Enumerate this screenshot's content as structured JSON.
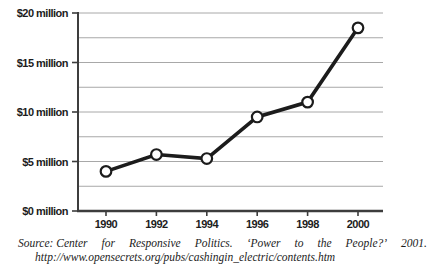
{
  "chart_data": {
    "type": "line",
    "categories": [
      "1990",
      "1992",
      "1994",
      "1996",
      "1998",
      "2000"
    ],
    "values": [
      4.0,
      5.7,
      5.3,
      9.5,
      11.0,
      18.5
    ],
    "ylim": [
      0,
      20
    ],
    "ytick_values": [
      0,
      5,
      10,
      15,
      20
    ],
    "ytick_labels": [
      "$0 million",
      "$5 million",
      "$10 million",
      "$15 million",
      "$20 million"
    ],
    "grid_step": 2.5,
    "grid": "horizontal",
    "legend": "none",
    "line_color": "#1c1c1c",
    "marker": "open-circle",
    "marker_fill": "#ffffff",
    "grid_color": "#a8a8a8",
    "axis_color": "#3d3d3d",
    "label_color": "#1c1c1c"
  },
  "source": {
    "line1_words": [
      "Source: Center",
      "for",
      "Responsive",
      "Politics.",
      "‘Power",
      "to",
      "the",
      "People?’",
      "2001."
    ],
    "line2": "http://www.opensecrets.org/pubs/cashingin_electric/contents.htm"
  }
}
